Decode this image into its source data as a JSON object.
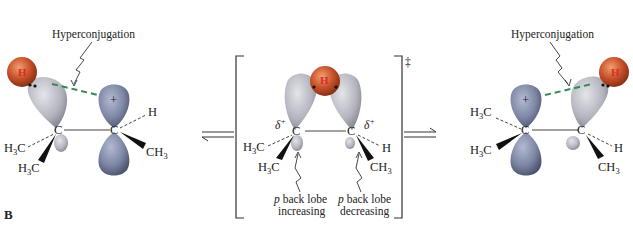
{
  "figure": {
    "panel_label": "B",
    "colors": {
      "empty_p_lobe": "#7d86a3",
      "sp3_lobe": "#b4b4be",
      "hydrogen": "#c9542c",
      "hydrogen_label": "#d92b2b",
      "hyperconjugation_line": "#2f8a55",
      "bond": "#444444",
      "wedge": "#111111"
    }
  },
  "left_structure": {
    "annotation": "Hyperconjugation",
    "migrating_atom": "H",
    "carbon_left": "C",
    "carbon_right": "C",
    "cation_charge": "+",
    "substituents": {
      "left_dash": "H3C",
      "left_wedge": "H3C",
      "right_dash": "H",
      "right_wedge": "CH3"
    }
  },
  "transition_state": {
    "marker": "‡",
    "migrating_atom": "H",
    "carbon_left": "C",
    "carbon_right": "C",
    "partial_charge_left": "δ+",
    "partial_charge_right": "δ+",
    "substituents": {
      "left_dash": "H3C",
      "left_wedge": "H3C",
      "right_dash": "H",
      "right_wedge": "CH3"
    },
    "note_left": {
      "line1": "p back lobe",
      "line2": "increasing"
    },
    "note_right": {
      "line1": "p back lobe",
      "line2": "decreasing"
    }
  },
  "right_structure": {
    "annotation": "Hyperconjugation",
    "migrating_atom": "H",
    "carbon_left": "C",
    "carbon_right": "C",
    "cation_charge": "+",
    "substituents": {
      "left_dash": "H3C",
      "left_wedge": "H3C",
      "right_dash": "H",
      "right_wedge": "CH3"
    }
  },
  "arrows": {
    "left": "equilibrium",
    "right": "equilibrium"
  }
}
